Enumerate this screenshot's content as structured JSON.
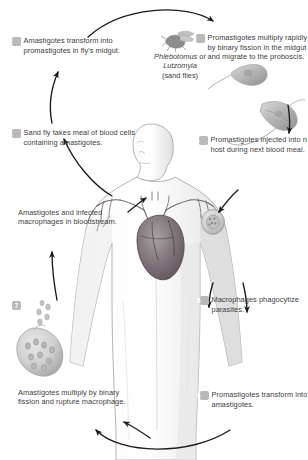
{
  "diagram": {
    "background_color": "#ffffff",
    "text_color": "#3d3d3d",
    "badge_color": "#b9b9b9",
    "badge_text_color": "#ffffff"
  },
  "vector": {
    "genus_1": "Phlebotomus",
    "conjunction": " or",
    "genus_2": "Lutzomyia",
    "common_name": "(sand flies)"
  },
  "steps": [
    {
      "number": "1",
      "text": "Sand fly takes meal of blood cells containing amastigotes."
    },
    {
      "number": "2",
      "text": "Amastigotes transform into promastigotes in fly's midgut."
    },
    {
      "number": "3",
      "text": "Promastigotes multiply rapidly by binary fission in the midgut and migrate to the proboscis."
    },
    {
      "number": "4",
      "text": "Promastigotes injected into new host during next blood meal."
    },
    {
      "number": "5",
      "text": "Macrophages phagocytize parasites."
    },
    {
      "number": "6",
      "text": "Promastigotes transform into amastigotes."
    },
    {
      "number": "7",
      "text": "Amastigotes multiply by binary fission and rupture macrophage."
    }
  ],
  "unnumbered_labels": [
    {
      "id": "bloodstream",
      "text": "Amastigotes and infected macrophages in bloodstream."
    }
  ],
  "illustrations": [
    {
      "name": "sand-fly",
      "description": "sand fly insect"
    },
    {
      "name": "promastigote",
      "description": "flagellated promastigote"
    },
    {
      "name": "human-host",
      "description": "human torso with heart and vasculature"
    },
    {
      "name": "skin-lesion-macrophage",
      "description": "macrophage at injection site on shoulder"
    },
    {
      "name": "ruptured-macrophage",
      "description": "macrophage rupturing and releasing amastigotes"
    }
  ]
}
